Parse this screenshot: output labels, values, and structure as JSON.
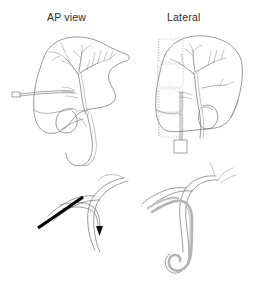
{
  "figure": {
    "background_color": "#ffffff",
    "width": 259,
    "height": 282,
    "panel_count": 4,
    "panels": [
      {
        "id": "ap-view",
        "label": "AP view",
        "position": "top-left",
        "description": "Anteroposterior projection of liver with intrahepatic biliary tree, gallbladder and common bile duct; access needle entering from the patient's right flank",
        "label_x": 47,
        "label_y": 12
      },
      {
        "id": "lateral-view",
        "label": "Lateral",
        "position": "top-right",
        "description": "Lateral projection of liver with biliary tree overlying dotted vertebral bodies; vertical needle tract descending to skin entry marker",
        "label_x": 167,
        "label_y": 12
      },
      {
        "id": "needle-access-detail",
        "label": "",
        "position": "bottom-left",
        "description": "Magnified view of bile duct with black access needle entering obliquely and guidewire advanced to tip marker"
      },
      {
        "id": "catheter-detail",
        "label": "",
        "position": "bottom-right",
        "description": "Magnified view of drainage catheter advanced into the duct with distal pigtail loop formed"
      }
    ]
  },
  "labels": {
    "ap_view": "AP view",
    "lateral": "Lateral"
  },
  "markers": {
    "needle_hub": {
      "shape": "rectangle",
      "x": 12,
      "y": 92,
      "width": 8,
      "height": 5
    },
    "skin_entry_square": {
      "shape": "square",
      "x": 174,
      "y": 140,
      "size": 13
    },
    "wire_tip": {
      "shape": "arrowhead",
      "x": 100,
      "y": 228
    }
  },
  "vertebral_bodies": {
    "count": 4,
    "style": "dotted-outline",
    "color": "#a9a9ae"
  },
  "colors": {
    "outline": "#6d6d70",
    "fine_line": "#8a8a8e",
    "vertebra_dash": "#a9a9ae",
    "catheter_gray": "#b4b4b8",
    "needle_black": "#000000",
    "text": "#2b2b2b",
    "background": "#ffffff"
  }
}
